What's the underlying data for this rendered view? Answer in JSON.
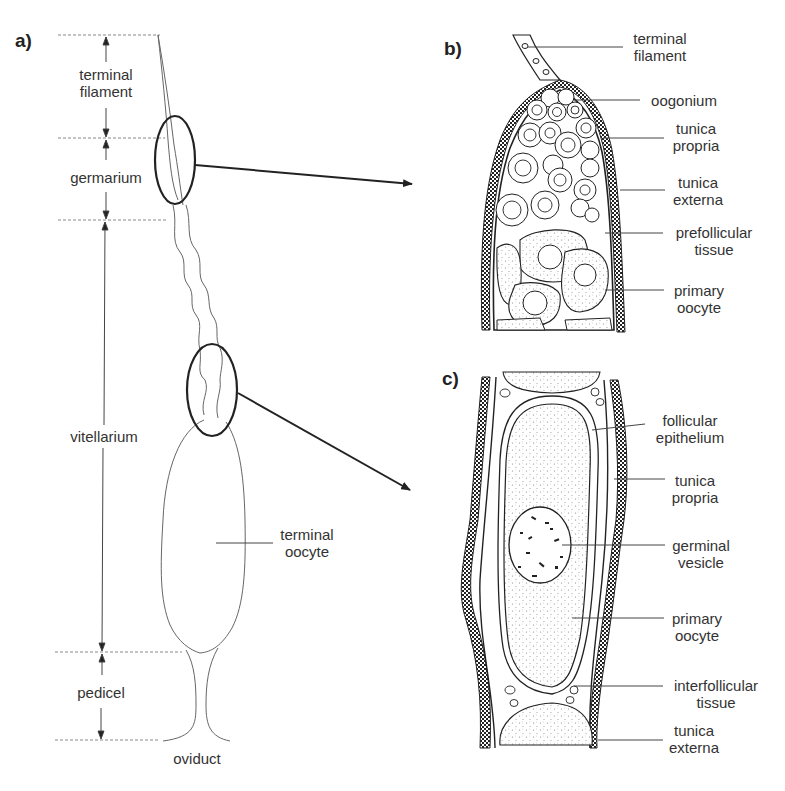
{
  "figure": {
    "panels": {
      "a": {
        "letter": "a)",
        "regions": [
          {
            "name": "terminal filament",
            "line1": "terminal",
            "line2": "filament"
          },
          {
            "name": "germarium",
            "line1": "germarium"
          },
          {
            "name": "vitellarium",
            "line1": "vitellarium"
          },
          {
            "name": "pedicel",
            "line1": "pedicel"
          }
        ],
        "terminal_oocyte": {
          "line1": "terminal",
          "line2": "oocyte"
        },
        "oviduct": "oviduct"
      },
      "b": {
        "letter": "b)",
        "labels": [
          {
            "line1": "terminal",
            "line2": "filament"
          },
          {
            "line1": "oogonium"
          },
          {
            "line1": "tunica",
            "line2": "propria"
          },
          {
            "line1": "tunica",
            "line2": "externa"
          },
          {
            "line1": "prefollicular",
            "line2": "tissue"
          },
          {
            "line1": "primary",
            "line2": "oocyte"
          }
        ]
      },
      "c": {
        "letter": "c)",
        "labels": [
          {
            "line1": "follicular",
            "line2": "epithelium"
          },
          {
            "line1": "tunica",
            "line2": "propria"
          },
          {
            "line1": "germinal",
            "line2": "vesicle"
          },
          {
            "line1": "primary",
            "line2": "oocyte"
          },
          {
            "line1": "interfollicular",
            "line2": "tissue"
          },
          {
            "line1": "tunica",
            "line2": "externa"
          }
        ]
      }
    },
    "colors": {
      "ink": "#222222",
      "thin": "#555555",
      "dashed": "#888888",
      "stipple": "#9a9a9a"
    }
  }
}
